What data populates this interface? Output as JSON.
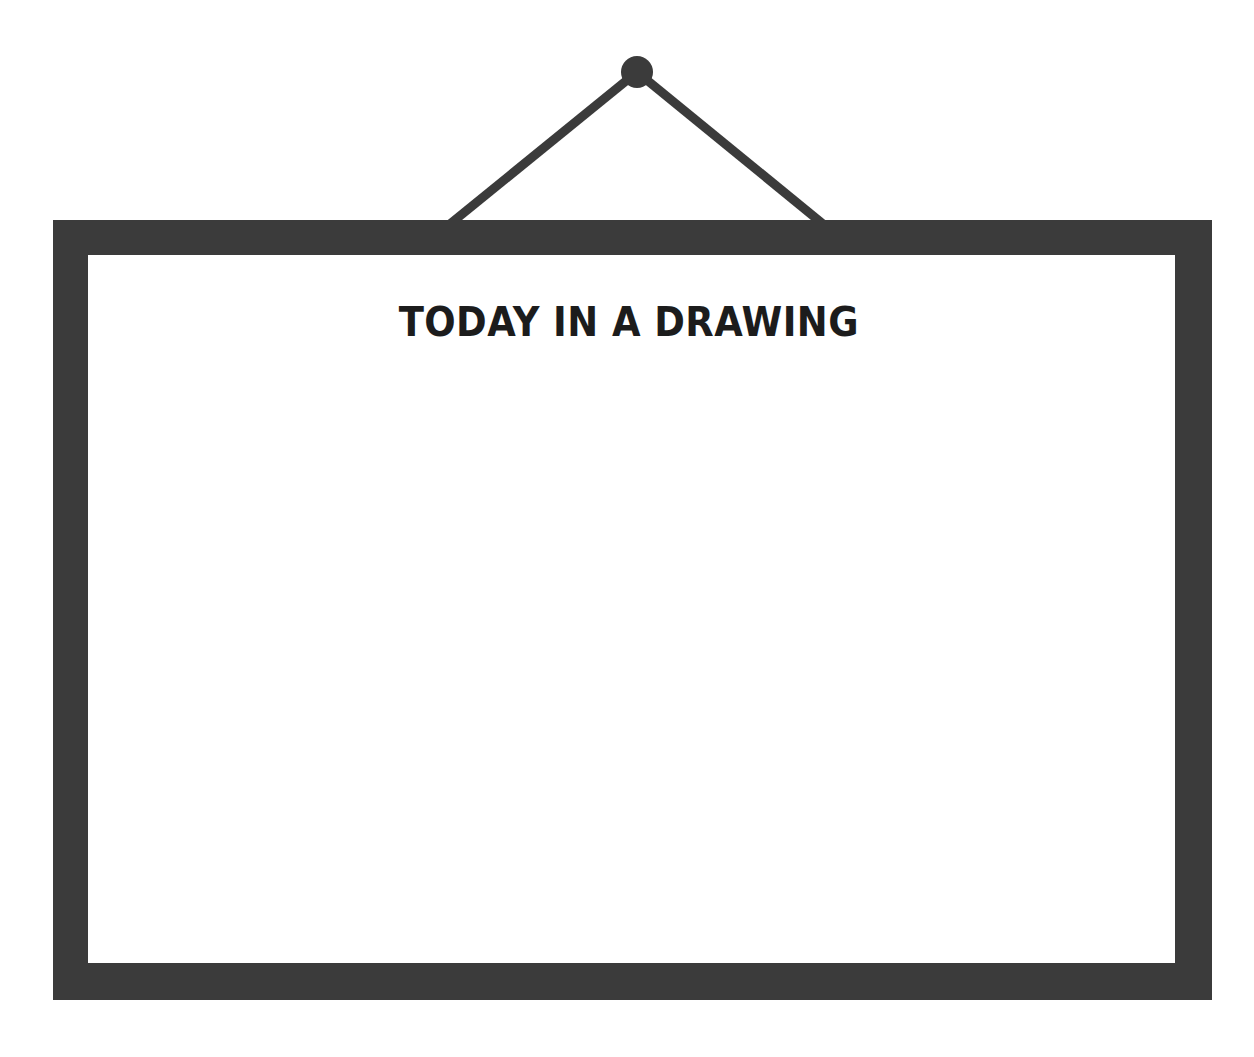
{
  "scene": {
    "background_color": "#ffffff",
    "description_name": "hanging-whiteboard"
  },
  "hanger": {
    "nail_name": "nail",
    "nail_color": "#3b3b3b",
    "nail_center_x": 637,
    "nail_center_y": 72,
    "nail_radius": 16,
    "cord_color": "#3b3b3b",
    "cord_thickness": 9,
    "left_cord_end_x": 450,
    "left_cord_end_y": 224,
    "right_cord_end_x": 823,
    "right_cord_end_y": 224
  },
  "board": {
    "frame_color": "#3b3b3b",
    "surface_color": "#ffffff",
    "title": "TODAY IN A DRAWING",
    "content": ""
  }
}
